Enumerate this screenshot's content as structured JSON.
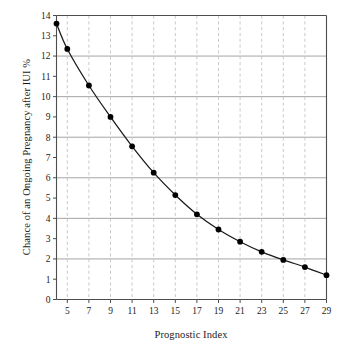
{
  "chart_data": {
    "type": "line",
    "title": "",
    "subtitle": "",
    "xlabel": "Prognostic Index",
    "ylabel": "Chance of an Ongoing Pregnancy after IUI %",
    "xlim": [
      4,
      29
    ],
    "ylim": [
      0,
      14
    ],
    "xticks": [
      5,
      7,
      9,
      11,
      13,
      15,
      17,
      19,
      21,
      23,
      25,
      27,
      29
    ],
    "xtick_labels": [
      "5",
      "7",
      "9",
      "11",
      "13",
      "15",
      "17",
      "19",
      "21",
      "23",
      "25",
      "27",
      "29"
    ],
    "yticks": [
      0,
      1,
      2,
      3,
      4,
      5,
      6,
      7,
      8,
      9,
      10,
      11,
      12,
      13,
      14
    ],
    "ytick_labels": [
      "0",
      "1",
      "2",
      "3",
      "4",
      "5",
      "6",
      "7",
      "8",
      "9",
      "10",
      "11",
      "12",
      "13",
      "14"
    ],
    "grid": {
      "horizontal_values": [
        2,
        4,
        6,
        8,
        10,
        12
      ],
      "horizontal_style": "solid",
      "vertical_values": [
        5,
        7,
        9,
        11,
        13,
        15,
        17,
        19,
        21,
        23,
        25,
        27
      ],
      "vertical_style": "dashed"
    },
    "legend": {
      "visible": false,
      "position": "none"
    },
    "annotations": [],
    "series": [
      {
        "name": "Chance of an Ongoing Pregnancy after IUI",
        "marker": "filled-circle",
        "line_color": "#1a1a1a",
        "marker_color": "#000000",
        "x": [
          4,
          5,
          7,
          9,
          11,
          13,
          15,
          17,
          19,
          21,
          23,
          25,
          27,
          29
        ],
        "values": [
          13.6,
          12.35,
          10.55,
          9.0,
          7.55,
          6.25,
          5.15,
          4.2,
          3.45,
          2.85,
          2.35,
          1.95,
          1.6,
          1.2
        ]
      }
    ]
  },
  "colors": {
    "axis": "#4d4d4d",
    "grid_solid": "#9a9a9a",
    "grid_dashed": "#c4c4c4",
    "line": "#1a1a1a",
    "marker": "#000000",
    "text": "#1a1a1a",
    "background": "#ffffff"
  }
}
